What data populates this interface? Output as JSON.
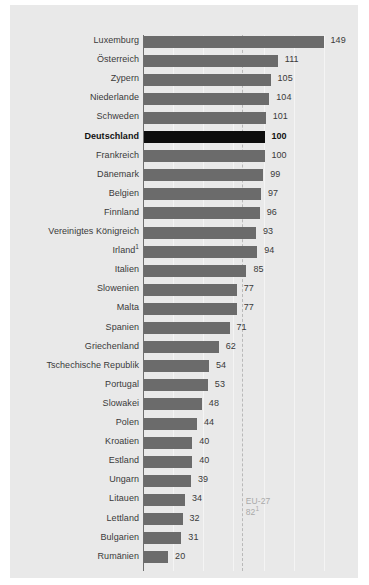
{
  "chart_data": {
    "type": "bar",
    "orientation": "horizontal",
    "title": "",
    "subtitle": "",
    "xlabel": "",
    "ylabel": "",
    "xlim": [
      0,
      162
    ],
    "grid": true,
    "legend": null,
    "categories": [
      "Luxemburg",
      "Österreich",
      "Zypern",
      "Niederlande",
      "Schweden",
      "Deutschland",
      "Frankreich",
      "Dänemark",
      "Belgien",
      "Finnland",
      "Vereinigtes Königreich",
      "Irland",
      "Italien",
      "Slowenien",
      "Malta",
      "Spanien",
      "Griechenland",
      "Tschechische Republik",
      "Portugal",
      "Slowakei",
      "Polen",
      "Kroatien",
      "Estland",
      "Ungarn",
      "Litauen",
      "Lettland",
      "Bulgarien",
      "Rumänien"
    ],
    "values": [
      149,
      111,
      105,
      104,
      101,
      100,
      100,
      99,
      97,
      96,
      93,
      94,
      85,
      77,
      77,
      71,
      62,
      54,
      53,
      48,
      44,
      40,
      40,
      39,
      34,
      32,
      31,
      20
    ],
    "rows": [
      {
        "label": "Luxemburg",
        "footnote": "",
        "value": 149,
        "value_text": "149",
        "highlight": false
      },
      {
        "label": "Österreich",
        "footnote": "",
        "value": 111,
        "value_text": "111",
        "highlight": false
      },
      {
        "label": "Zypern",
        "footnote": "",
        "value": 105,
        "value_text": "105",
        "highlight": false
      },
      {
        "label": "Niederlande",
        "footnote": "",
        "value": 104,
        "value_text": "104",
        "highlight": false
      },
      {
        "label": "Schweden",
        "footnote": "",
        "value": 101,
        "value_text": "101",
        "highlight": false
      },
      {
        "label": "Deutschland",
        "footnote": "",
        "value": 100,
        "value_text": "100",
        "highlight": true
      },
      {
        "label": "Frankreich",
        "footnote": "",
        "value": 100,
        "value_text": "100",
        "highlight": false
      },
      {
        "label": "Dänemark",
        "footnote": "",
        "value": 99,
        "value_text": "99",
        "highlight": false
      },
      {
        "label": "Belgien",
        "footnote": "",
        "value": 97,
        "value_text": "97",
        "highlight": false
      },
      {
        "label": "Finnland",
        "footnote": "",
        "value": 96,
        "value_text": "96",
        "highlight": false
      },
      {
        "label": "Vereinigtes Königreich",
        "footnote": "",
        "value": 93,
        "value_text": "93",
        "highlight": false
      },
      {
        "label": "Irland",
        "footnote": "1",
        "value": 94,
        "value_text": "94",
        "highlight": false
      },
      {
        "label": "Italien",
        "footnote": "",
        "value": 85,
        "value_text": "85",
        "highlight": false
      },
      {
        "label": "Slowenien",
        "footnote": "",
        "value": 77,
        "value_text": "77",
        "highlight": false
      },
      {
        "label": "Malta",
        "footnote": "",
        "value": 77,
        "value_text": "77",
        "highlight": false
      },
      {
        "label": "Spanien",
        "footnote": "",
        "value": 71,
        "value_text": "71",
        "highlight": false
      },
      {
        "label": "Griechenland",
        "footnote": "",
        "value": 62,
        "value_text": "62",
        "highlight": false
      },
      {
        "label": "Tschechische Republik",
        "footnote": "",
        "value": 54,
        "value_text": "54",
        "highlight": false
      },
      {
        "label": "Portugal",
        "footnote": "",
        "value": 53,
        "value_text": "53",
        "highlight": false
      },
      {
        "label": "Slowakei",
        "footnote": "",
        "value": 48,
        "value_text": "48",
        "highlight": false
      },
      {
        "label": "Polen",
        "footnote": "",
        "value": 44,
        "value_text": "44",
        "highlight": false
      },
      {
        "label": "Kroatien",
        "footnote": "",
        "value": 40,
        "value_text": "40",
        "highlight": false
      },
      {
        "label": "Estland",
        "footnote": "",
        "value": 40,
        "value_text": "40",
        "highlight": false
      },
      {
        "label": "Ungarn",
        "footnote": "",
        "value": 39,
        "value_text": "39",
        "highlight": false
      },
      {
        "label": "Litauen",
        "footnote": "",
        "value": 34,
        "value_text": "34",
        "highlight": false
      },
      {
        "label": "Lettland",
        "footnote": "",
        "value": 32,
        "value_text": "32",
        "highlight": false
      },
      {
        "label": "Bulgarien",
        "footnote": "",
        "value": 31,
        "value_text": "31",
        "highlight": false
      },
      {
        "label": "Rumänien",
        "footnote": "",
        "value": 20,
        "value_text": "20",
        "highlight": false
      }
    ],
    "reference_line": {
      "name": "EU-27",
      "value": 82,
      "value_text": "82",
      "footnote": "1",
      "style": "dashed"
    },
    "gridline_values": [
      25,
      50,
      75,
      100,
      125,
      150
    ],
    "colors": {
      "panel_background": "#e9e9e9",
      "bar": "#6b6b6b",
      "bar_highlight": "#0d0d0d",
      "gridline": "#f4f4f4",
      "axis": "#6e6e6e",
      "reference_line": "#b9b9b9",
      "reference_label": "#a9a9a9",
      "text": "#3a3a3a"
    }
  }
}
